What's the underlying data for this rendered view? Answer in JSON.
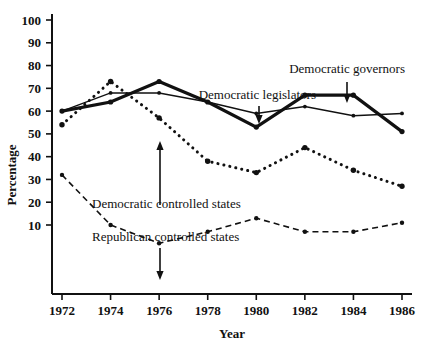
{
  "chart_data": {
    "type": "line",
    "title": "",
    "xlabel": "Year",
    "ylabel": "Percentage",
    "x": [
      1972,
      1974,
      1976,
      1978,
      1980,
      1982,
      1984,
      1986
    ],
    "xtick_labels": [
      "1972",
      "1974",
      "1976",
      "1978",
      "1980",
      "1982",
      "1984",
      "1986"
    ],
    "ytick_labels": [
      "100",
      "90",
      "80",
      "70",
      "60",
      "50",
      "40",
      "30",
      "20",
      "10"
    ],
    "ytick_values": [
      100,
      90,
      80,
      70,
      60,
      50,
      40,
      30,
      20,
      10
    ],
    "xlim": [
      1972,
      1986
    ],
    "ylim": [
      0,
      100
    ],
    "grid": false,
    "legend_position": "inline-annotations",
    "series": [
      {
        "name": "Democratic governors",
        "style": "thick-solid",
        "values": [
          60,
          64,
          73,
          64,
          53,
          67,
          67,
          51
        ]
      },
      {
        "name": "Democratic legislators",
        "style": "thin-solid",
        "values": [
          60,
          68,
          68,
          64,
          59,
          62,
          58,
          59
        ]
      },
      {
        "name": "Democratic controlled states",
        "style": "dotted",
        "values": [
          54,
          73,
          57,
          38,
          33,
          44,
          34,
          27
        ]
      },
      {
        "name": "Republican controlled states",
        "style": "dashed",
        "values": [
          32,
          10,
          2,
          7,
          13,
          7,
          7,
          11
        ]
      }
    ],
    "annotations": [
      {
        "name": "democratic-governors",
        "label": "Democratic governors",
        "target_x": 1984,
        "target_y": 67
      },
      {
        "name": "democratic-legislators",
        "label": "Democratic legislators",
        "target_x": 1980,
        "target_y": 59
      },
      {
        "name": "democratic-controlled-states",
        "label": "Democratic controlled states",
        "target_x": 1976,
        "target_y": 57
      },
      {
        "name": "republican-controlled-states",
        "label": "Republican controlled states",
        "target_x": 1976,
        "target_y": 2
      }
    ],
    "colors": {
      "ink": "#111111",
      "background": "#ffffff"
    }
  }
}
